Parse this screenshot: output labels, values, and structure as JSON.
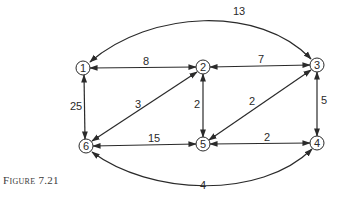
{
  "caption": "Figure 7.21",
  "graph": {
    "directed": true,
    "bidirectional_edges": true,
    "colors": {
      "stroke": "#2a2a2a",
      "background": "#ffffff"
    },
    "nodes": [
      {
        "id": "1",
        "label": "1",
        "x": 83,
        "y": 68
      },
      {
        "id": "2",
        "label": "2",
        "x": 203,
        "y": 67
      },
      {
        "id": "3",
        "label": "3",
        "x": 317,
        "y": 65
      },
      {
        "id": "4",
        "label": "4",
        "x": 317,
        "y": 143
      },
      {
        "id": "5",
        "label": "5",
        "x": 203,
        "y": 144
      },
      {
        "id": "6",
        "label": "6",
        "x": 86,
        "y": 146
      }
    ],
    "edges": [
      {
        "from": "1",
        "to": "2",
        "weight": "8"
      },
      {
        "from": "2",
        "to": "3",
        "weight": "7"
      },
      {
        "from": "1",
        "to": "3",
        "weight": "13",
        "curved": "top"
      },
      {
        "from": "1",
        "to": "6",
        "weight": "25"
      },
      {
        "from": "6",
        "to": "2",
        "weight": "3"
      },
      {
        "from": "2",
        "to": "5",
        "weight": "2"
      },
      {
        "from": "5",
        "to": "3",
        "weight": "2"
      },
      {
        "from": "3",
        "to": "4",
        "weight": "5"
      },
      {
        "from": "6",
        "to": "5",
        "weight": "15"
      },
      {
        "from": "5",
        "to": "4",
        "weight": "2"
      },
      {
        "from": "6",
        "to": "4",
        "weight": "4",
        "curved": "bottom"
      }
    ]
  }
}
